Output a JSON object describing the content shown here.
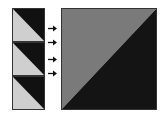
{
  "diagram": {
    "small_tiles": [
      {
        "top": 8,
        "light_color": "#cfcfcf",
        "dark_color": "#111111"
      },
      {
        "top": 42,
        "light_color": "#cfcfcf",
        "dark_color": "#111111"
      },
      {
        "top": 76,
        "light_color": "#cfcfcf",
        "dark_color": "#111111"
      }
    ],
    "arrows": [
      {
        "top": 25
      },
      {
        "top": 39
      },
      {
        "top": 56
      },
      {
        "top": 70
      }
    ],
    "big_block": {
      "light_color": "#7a7a7a",
      "dark_color": "#141414"
    },
    "colors": {
      "border": "#222222",
      "arrow": "#111111"
    }
  }
}
